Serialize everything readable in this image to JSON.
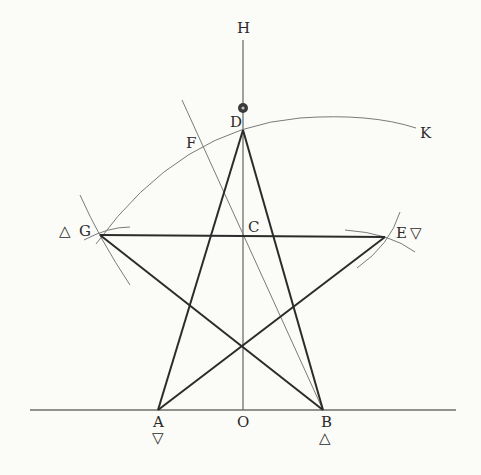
{
  "diagram": {
    "points": {
      "H": {
        "label": "H",
        "x": 243,
        "y": 28
      },
      "D": {
        "label": "D",
        "x": 243,
        "y": 130
      },
      "F": {
        "label": "F",
        "x": 192,
        "y": 142
      },
      "K": {
        "label": "K",
        "x": 425,
        "y": 130
      },
      "G": {
        "label": "G",
        "x": 100,
        "y": 235,
        "symbol": "△"
      },
      "C": {
        "label": "C",
        "x": 243,
        "y": 237
      },
      "E": {
        "label": "E",
        "x": 385,
        "y": 237,
        "symbol": "▽"
      },
      "A": {
        "label": "A",
        "x": 158,
        "y": 410,
        "symbol": "▽"
      },
      "O": {
        "label": "O",
        "x": 243,
        "y": 410
      },
      "B": {
        "label": "B",
        "x": 323,
        "y": 410,
        "symbol": "△"
      }
    },
    "marker": {
      "name": "sun-symbol",
      "glyph": "⊕"
    },
    "colors": {
      "background": "#fbfbf8",
      "thick_line": "#2b2b2b",
      "thin_line": "#7a7a7a",
      "text": "#2a2a2a"
    }
  }
}
